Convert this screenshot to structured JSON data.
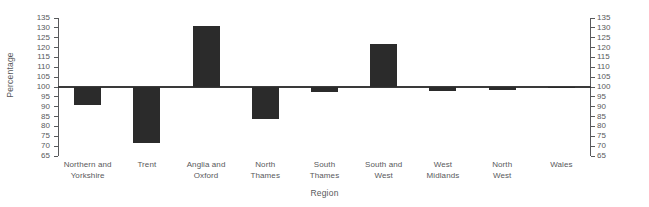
{
  "chart_data": {
    "type": "bar",
    "title": "",
    "subtitle": "",
    "xlabel": "Region",
    "ylabel": "Percentage",
    "categories": [
      "Northern and Yorkshire",
      "Trent",
      "Anglia and Oxford",
      "North Thames",
      "South Thames",
      "South and West",
      "West Midlands",
      "North West",
      "Wales"
    ],
    "category_lines": [
      [
        "Northern and",
        "Yorkshire"
      ],
      [
        "Trent"
      ],
      [
        "Anglia and",
        "Oxford"
      ],
      [
        "North",
        "Thames"
      ],
      [
        "South",
        "Thames"
      ],
      [
        "South and",
        "West"
      ],
      [
        "West",
        "Midlands"
      ],
      [
        "North",
        "West"
      ],
      [
        "Wales"
      ]
    ],
    "values": [
      91,
      71.5,
      131,
      84,
      97.5,
      122,
      98,
      98.5,
      99.8
    ],
    "baseline": 100,
    "ylim": [
      65,
      135
    ],
    "ytick_step": 5,
    "yticks": [
      135,
      130,
      125,
      120,
      115,
      110,
      105,
      100,
      95,
      90,
      85,
      80,
      75,
      70,
      65
    ],
    "right_axis": true,
    "right_yticks": [
      135,
      130,
      125,
      120,
      115,
      110,
      105,
      100,
      95,
      90,
      85,
      80,
      75,
      70,
      65
    ],
    "grid": false,
    "legend": null,
    "bar_color": "#2b2b2b",
    "axis_color": "#58595b",
    "baseline_color": "#3a3a3a",
    "background": "#ffffff"
  }
}
